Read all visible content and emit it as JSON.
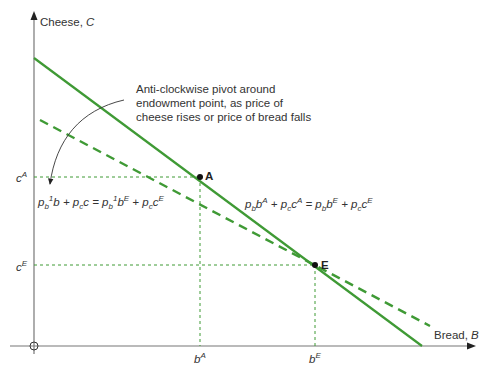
{
  "axes": {
    "y_label": "Cheese, ",
    "y_var": "C",
    "x_label": "Bread, ",
    "x_var": "B",
    "origin": "O"
  },
  "ticks": {
    "cA": "c",
    "cA_sup": "A",
    "cE": "c",
    "cE_sup": "E",
    "bA": "b",
    "bA_sup": "A",
    "bE": "b",
    "bE_sup": "E"
  },
  "points": {
    "A": "A",
    "E": "E"
  },
  "annotation": {
    "line1": "Anti-clockwise pivot around",
    "line2": "endowment point, as price of",
    "line3": "cheese rises or price of bread falls"
  },
  "equations": {
    "original": "p_b b^A + p_c c^A = p_b b^E + p_c c^E",
    "new": "p_b^1 b + p_c c = p_b^1 b^E + p_c c^E"
  },
  "colors": {
    "budget_line": "#3f9a35",
    "axis": "#666666",
    "guide": "#3f9a35",
    "text": "#333333"
  }
}
